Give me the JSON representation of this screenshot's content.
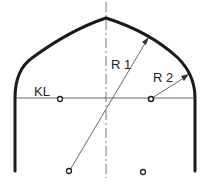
{
  "diagram": {
    "title": "",
    "labels": {
      "kl": "KL",
      "r1": "R 1",
      "r2": "R 2"
    },
    "colors": {
      "outline": "#1a1a1a",
      "thin": "#444444",
      "background": "#ffffff"
    }
  }
}
